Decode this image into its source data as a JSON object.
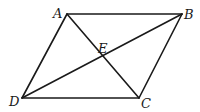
{
  "diagram": {
    "type": "parallelogram-with-diagonals",
    "points": {
      "A": {
        "label": "A",
        "x": 67,
        "y": 14
      },
      "B": {
        "label": "B",
        "x": 182,
        "y": 14
      },
      "C": {
        "label": "C",
        "x": 139,
        "y": 98
      },
      "D": {
        "label": "D",
        "x": 22,
        "y": 98
      },
      "E": {
        "label": "E",
        "x": 102,
        "y": 58
      }
    },
    "segments": [
      "AB",
      "BC",
      "CD",
      "DA",
      "AC",
      "BD"
    ]
  }
}
